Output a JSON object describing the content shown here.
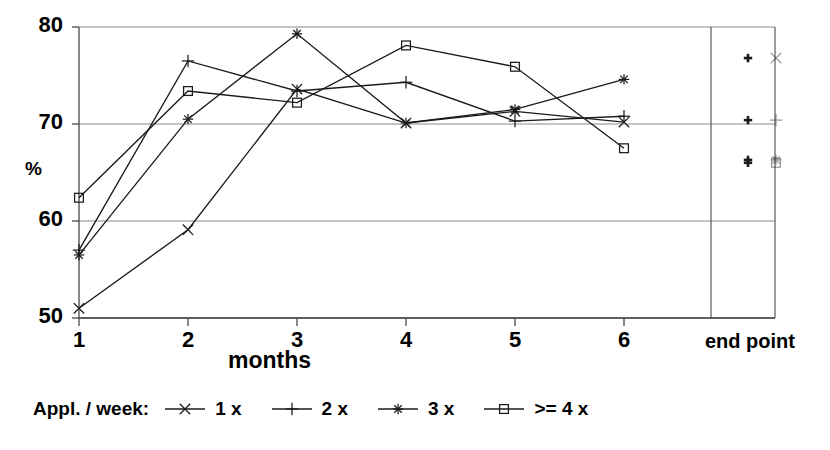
{
  "chart_data": {
    "type": "line",
    "title": "",
    "xlabel": "months",
    "ylabel": "%",
    "x": [
      1,
      2,
      3,
      4,
      5,
      6
    ],
    "categories": [
      "1",
      "2",
      "3",
      "4",
      "5",
      "6"
    ],
    "xtick_labels": [
      "1",
      "2",
      "3",
      "4",
      "5",
      "6"
    ],
    "ytick_labels": [
      "50",
      "60",
      "70",
      "80"
    ],
    "ytick_values": [
      50,
      60,
      70,
      80
    ],
    "ylim": [
      50,
      80
    ],
    "xlim": [
      1,
      6
    ],
    "grid": "horizontal",
    "legend_position": "below-axes",
    "legend_title": "Appl. / week:",
    "series": [
      {
        "name": "1 x",
        "marker": "x-cross",
        "values": [
          51.0,
          59.1,
          73.6,
          70.1,
          71.3,
          70.2
        ],
        "end_point": 76.8
      },
      {
        "name": "2 x",
        "marker": "plus",
        "values": [
          57.0,
          76.5,
          73.4,
          74.3,
          70.3,
          70.8
        ],
        "end_point": 70.4
      },
      {
        "name": "3 x",
        "marker": "asterisk",
        "values": [
          56.5,
          70.5,
          79.3,
          70.1,
          71.5,
          74.6
        ],
        "end_point": 66.3
      },
      {
        "name": ">= 4 x",
        "marker": "square",
        "values": [
          62.4,
          73.4,
          72.2,
          78.1,
          75.9,
          67.5
        ],
        "end_point": 66.0
      }
    ],
    "endpoint_panel": {
      "label": "end point",
      "values": [
        76.8,
        70.4,
        66.3,
        66.0
      ]
    },
    "colors": {
      "line": "#1a1a1a",
      "grid": "#8a8a8a",
      "axis": "#4a4a4a",
      "background": "#ffffff"
    }
  }
}
